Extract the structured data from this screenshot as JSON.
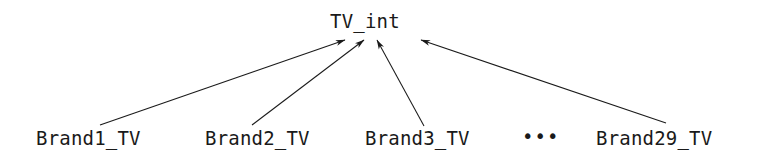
{
  "diagram": {
    "type": "generalization-hierarchy",
    "background_color": "#ffffff",
    "edge_color": "#1a1a1a",
    "text_color": "#1a1a1a",
    "root": {
      "label": "TV_int"
    },
    "leaves": [
      {
        "label": "Brand1_TV"
      },
      {
        "label": "Brand2_TV"
      },
      {
        "label": "Brand3_TV"
      },
      {
        "label": "Brand29_TV"
      }
    ],
    "ellipsis": "•••",
    "edges": [
      {
        "from": "Brand1_TV",
        "to": "TV_int",
        "x1": 100,
        "y1": 125,
        "x2": 345,
        "y2": 40
      },
      {
        "from": "Brand2_TV",
        "to": "TV_int",
        "x1": 252,
        "y1": 125,
        "x2": 364,
        "y2": 40
      },
      {
        "from": "Brand3_TV",
        "to": "TV_int",
        "x1": 424,
        "y1": 126,
        "x2": 377,
        "y2": 40
      },
      {
        "from": "Brand29_TV",
        "to": "TV_int",
        "x1": 666,
        "y1": 123,
        "x2": 421,
        "y2": 40
      }
    ]
  }
}
